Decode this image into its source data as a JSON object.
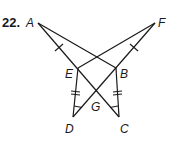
{
  "problem": {
    "number": "22."
  },
  "figure": {
    "points": [
      {
        "name": "A",
        "x": 38,
        "y": 23,
        "lx": 26,
        "ly": 26
      },
      {
        "name": "F",
        "x": 155,
        "y": 23,
        "lx": 158,
        "ly": 26
      },
      {
        "name": "E",
        "x": 78,
        "y": 68,
        "lx": 65,
        "ly": 78
      },
      {
        "name": "B",
        "x": 116,
        "y": 68,
        "lx": 120,
        "ly": 78
      },
      {
        "name": "G",
        "x": 97,
        "y": 91,
        "lx": 91,
        "ly": 111
      },
      {
        "name": "D",
        "x": 73,
        "y": 117,
        "lx": 65,
        "ly": 133
      },
      {
        "name": "C",
        "x": 119,
        "y": 117,
        "lx": 120,
        "ly": 133
      }
    ],
    "segments": [
      "A-C",
      "F-D",
      "A-B",
      "F-E",
      "E-D",
      "B-C"
    ],
    "markings": {
      "single_ticks": [
        "A-E",
        "F-B"
      ],
      "double_ticks": [
        "E-D",
        "B-C"
      ],
      "angle_marks": [
        "D",
        "C"
      ]
    }
  }
}
